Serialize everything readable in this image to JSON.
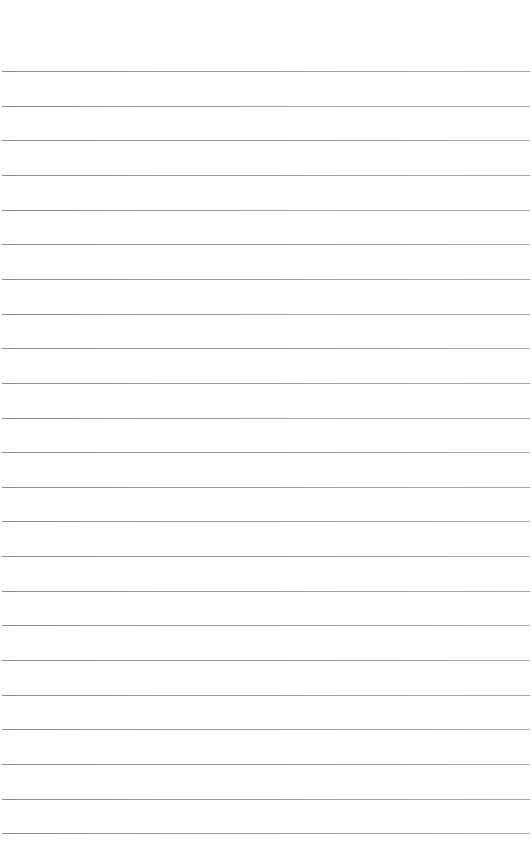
{
  "page": {
    "type": "blank lined paper",
    "background_color": "#ffffff",
    "line_color": "#9a9a9a",
    "line_count": 23,
    "first_line_y": 71,
    "line_spacing": 34.65,
    "line_left": 2,
    "line_right": 530
  }
}
